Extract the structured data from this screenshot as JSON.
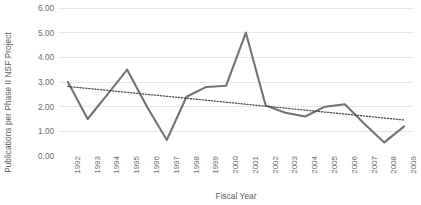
{
  "chart_data": {
    "type": "line",
    "title": "",
    "subtitle": "",
    "xlabel": "Fiscal Year",
    "ylabel": "Publications per Phase II NSF Project",
    "categories": [
      "1992",
      "1993",
      "1994",
      "1995",
      "1996",
      "1997",
      "1998",
      "1999",
      "2000",
      "2001",
      "2002",
      "2003",
      "2004",
      "2005",
      "2006",
      "2007",
      "2008",
      "2009"
    ],
    "series": [
      {
        "name": "Publications per Phase II NSF Project",
        "style": "solid",
        "color": "#737373",
        "values": [
          3.0,
          1.5,
          2.5,
          3.5,
          2.0,
          0.65,
          2.4,
          2.8,
          2.85,
          5.0,
          2.05,
          1.75,
          1.6,
          2.0,
          2.1,
          1.3,
          0.55,
          1.2
        ]
      },
      {
        "name": "Linear trendline",
        "style": "dotted",
        "color": "#4d4d4d",
        "values": [
          2.82,
          2.74,
          2.66,
          2.58,
          2.5,
          2.42,
          2.34,
          2.26,
          2.18,
          2.1,
          2.02,
          1.94,
          1.86,
          1.78,
          1.7,
          1.62,
          1.54,
          1.46
        ]
      }
    ],
    "ylim": [
      0,
      6
    ],
    "yticks": [
      0,
      1,
      2,
      3,
      4,
      5,
      6
    ],
    "ytick_labels": [
      "0.00",
      "1.00",
      "2.00",
      "3.00",
      "4.00",
      "5.00",
      "6.00"
    ],
    "grid": true,
    "grid_axis": "y",
    "grid_color": "#e6e6e6",
    "legend": false,
    "legend_position": "none",
    "background": "#ffffff"
  }
}
